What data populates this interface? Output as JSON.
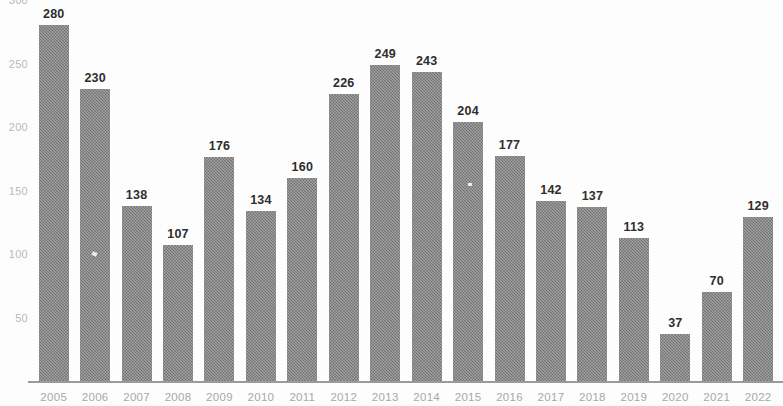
{
  "chart_data": {
    "type": "bar",
    "title": "",
    "subtitle": "",
    "xlabel": "",
    "ylabel": "",
    "categories": [
      "2005",
      "2006",
      "2007",
      "2008",
      "2009",
      "2010",
      "2011",
      "2012",
      "2013",
      "2014",
      "2015",
      "2016",
      "2017",
      "2018",
      "2019",
      "2020",
      "2021",
      "2022"
    ],
    "values": [
      280,
      230,
      138,
      107,
      176,
      134,
      160,
      226,
      249,
      243,
      204,
      177,
      142,
      137,
      113,
      37,
      70,
      129
    ],
    "data_labels": [
      "280",
      "230",
      "138",
      "107",
      "176",
      "134",
      "160",
      "226",
      "249",
      "243",
      "204",
      "177",
      "142",
      "137",
      "113",
      "37",
      "70",
      "129"
    ],
    "ylim": [
      0,
      300
    ],
    "y_ticks": [
      300,
      250,
      200,
      150,
      100,
      50
    ],
    "y_tick_labels": [
      "300",
      "250",
      "200",
      "150",
      "100",
      "50"
    ],
    "grid": false,
    "legend": null,
    "legend_position": "none",
    "bar_color": "#7d7d7d",
    "label_color": "#2e2e2e",
    "axis_label_color": "#b0b0b0",
    "background_color": "#ffffff"
  }
}
